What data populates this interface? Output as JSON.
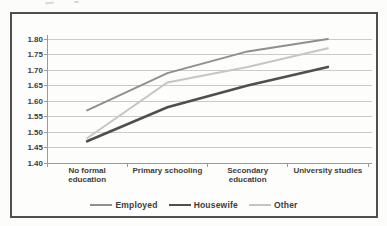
{
  "page": {
    "background": "#fcfcfa"
  },
  "chart_data": {
    "type": "line",
    "title": "",
    "categories": [
      "No formal\neducation",
      "Primary schooling",
      "Secondary\neducation",
      "University studies"
    ],
    "series": [
      {
        "name": "Employed",
        "values": [
          1.57,
          1.69,
          1.76,
          1.8
        ],
        "color": "#8f8f8f",
        "stroke_width": 2
      },
      {
        "name": "Housewife",
        "values": [
          1.47,
          1.58,
          1.65,
          1.71
        ],
        "color": "#4f4f4f",
        "stroke_width": 2.6
      },
      {
        "name": "Other",
        "values": [
          1.48,
          1.66,
          1.71,
          1.77
        ],
        "color": "#c6c6c6",
        "stroke_width": 2
      }
    ],
    "yAxis": {
      "min": 1.4,
      "max": 1.8,
      "step": 0.05,
      "ticklabels": [
        "1.80",
        "1.75",
        "1.70",
        "1.65",
        "1.60",
        "1.55",
        "1.50",
        "1.45",
        "1.40"
      ]
    },
    "xlabel": "",
    "ylabel": "",
    "grid": true,
    "legend_position": "bottom"
  },
  "style": {
    "gridline": "#cbcbcb",
    "axis": "#9b9b9b",
    "tick_text": "#3c3c3c",
    "frame_border": "#4f4f4f",
    "chart_background": "#fdfdfc"
  }
}
